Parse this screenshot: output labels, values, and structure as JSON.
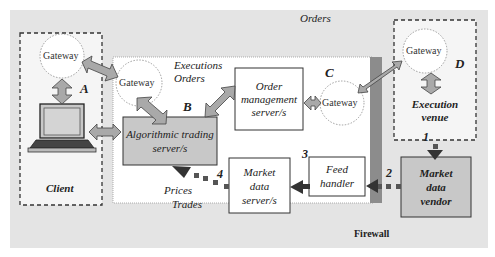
{
  "diagram": {
    "top_label": "Orders",
    "firewall_label": "Firewall",
    "client": {
      "label": "Client",
      "gateway": "Gateway",
      "marker": "A"
    },
    "internal": {
      "gateway_left": "Gateway",
      "gateway_right": "Gateway",
      "flow_labels": [
        "Executions",
        "Orders"
      ],
      "marker_b": "B",
      "marker_c": "C",
      "algo_server": [
        "Algorithmic trading",
        "server/s"
      ],
      "order_mgmt": [
        "Order",
        "management",
        "server/s"
      ],
      "market_data_server": [
        "Market",
        "data",
        "server/s"
      ],
      "feed_handler": [
        "Feed",
        "handler"
      ],
      "bottom_labels": [
        "Prices",
        "Trades"
      ],
      "step_3": "3",
      "step_4": "4"
    },
    "venue": {
      "gateway": "Gateway",
      "marker": "D",
      "label": [
        "Execution",
        "venue"
      ],
      "step_1": "1"
    },
    "vendor": {
      "label": [
        "Market",
        "data",
        "vendor"
      ],
      "step_2": "2"
    }
  },
  "colors": {
    "background": "#e4e4e4",
    "box_gray": "#c8c8c8",
    "arrow_fill": "#a9a9a9",
    "dark_arrow": "#3c3c3c",
    "firewall": "#8c8c8c"
  }
}
